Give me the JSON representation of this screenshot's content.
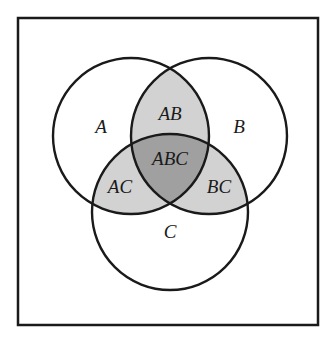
{
  "figure": {
    "name": "three-set-venn-diagram",
    "background_color": "#ffffff",
    "frame": {
      "stroke_color": "#1a1a1a",
      "fill_color": "#ffffff",
      "x": 18,
      "y": 18,
      "width": 300,
      "height": 307,
      "stroke_width": 2.5
    }
  },
  "colors": {
    "outline": "#1a1a1a",
    "circle_fill": "#ffffff",
    "pair_fill": "#d2d2d2",
    "triple_fill": "#a0a0a0"
  },
  "circles": [
    {
      "id": "A",
      "cx": 131,
      "cy": 136,
      "r": 78
    },
    {
      "id": "B",
      "cx": 209,
      "cy": 136,
      "r": 78
    },
    {
      "id": "C",
      "cx": 170,
      "cy": 212,
      "r": 78
    }
  ],
  "labels": {
    "a": {
      "text": "A",
      "x": 101,
      "y": 129,
      "kind": "single"
    },
    "b": {
      "text": "B",
      "x": 239,
      "y": 129,
      "kind": "single"
    },
    "c": {
      "text": "C",
      "x": 170,
      "y": 234,
      "kind": "single"
    },
    "ab": {
      "text": "AB",
      "x": 170,
      "y": 116,
      "kind": "pair"
    },
    "ac": {
      "text": "AC",
      "x": 120,
      "y": 189,
      "kind": "pair"
    },
    "bc": {
      "text": "BC",
      "x": 219,
      "y": 189,
      "kind": "pair"
    },
    "abc": {
      "text": "ABC",
      "x": 170,
      "y": 161,
      "kind": "triple"
    }
  },
  "chart_data": {
    "type": "diagram",
    "diagram_type": "venn",
    "title": "",
    "sets": [
      "A",
      "B",
      "C"
    ],
    "regions": [
      {
        "id": "A",
        "label": "A",
        "shading": "white",
        "fill": "#ffffff"
      },
      {
        "id": "B",
        "label": "B",
        "shading": "white",
        "fill": "#ffffff"
      },
      {
        "id": "C",
        "label": "C",
        "shading": "white",
        "fill": "#ffffff"
      },
      {
        "id": "AB",
        "label": "AB",
        "shading": "light-gray",
        "fill": "#d2d2d2"
      },
      {
        "id": "AC",
        "label": "AC",
        "shading": "light-gray",
        "fill": "#d2d2d2"
      },
      {
        "id": "BC",
        "label": "BC",
        "shading": "light-gray",
        "fill": "#d2d2d2"
      },
      {
        "id": "ABC",
        "label": "ABC",
        "shading": "dark-gray",
        "fill": "#a0a0a0"
      }
    ]
  }
}
